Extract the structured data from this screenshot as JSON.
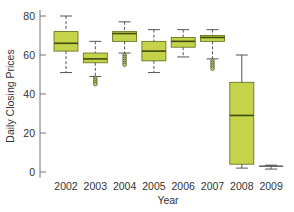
{
  "chart_data": {
    "type": "boxplot",
    "title": "",
    "xlabel": "Year",
    "ylabel": "Daily Closing Prices",
    "ylim": [
      0,
      80
    ],
    "yticks": [
      0,
      20,
      40,
      60,
      80
    ],
    "grid": false,
    "legend": null,
    "categories": [
      "2002",
      "2003",
      "2004",
      "2005",
      "2006",
      "2007",
      "2008",
      "2009"
    ],
    "boxes": [
      {
        "year": "2002",
        "whisker_low": 51,
        "q1": 62,
        "median": 66,
        "q3": 72,
        "whisker_high": 80,
        "outliers": []
      },
      {
        "year": "2003",
        "whisker_low": 49,
        "q1": 56,
        "median": 58,
        "q3": 61,
        "whisker_high": 67,
        "outliers": [
          48,
          47,
          46,
          45
        ]
      },
      {
        "year": "2004",
        "whisker_low": 61,
        "q1": 67,
        "median": 71,
        "q3": 72,
        "whisker_high": 77,
        "outliers": [
          60,
          59,
          58,
          57,
          56,
          55
        ]
      },
      {
        "year": "2005",
        "whisker_low": 51,
        "q1": 57,
        "median": 62,
        "q3": 67,
        "whisker_high": 73,
        "outliers": []
      },
      {
        "year": "2006",
        "whisker_low": 59,
        "q1": 64,
        "median": 67,
        "q3": 69,
        "whisker_high": 73,
        "outliers": []
      },
      {
        "year": "2007",
        "whisker_low": 58,
        "q1": 67,
        "median": 69,
        "q3": 70,
        "whisker_high": 73,
        "outliers": [
          57,
          56,
          55,
          54,
          53
        ]
      },
      {
        "year": "2008",
        "whisker_low": 2,
        "q1": 4,
        "median": 29,
        "q3": 46,
        "whisker_high": 60,
        "outliers": []
      },
      {
        "year": "2009",
        "whisker_low": 1.5,
        "q1": 2.5,
        "median": 3,
        "q3": 3,
        "whisker_high": 3.5,
        "outliers": []
      }
    ],
    "colors": {
      "box_fill": "#c5d34a",
      "box_stroke": "#5a6a1a",
      "median": "#3d4a10",
      "whisker": "#555555",
      "axis": "#777777",
      "outlier_fill": "#c5d34a"
    }
  }
}
